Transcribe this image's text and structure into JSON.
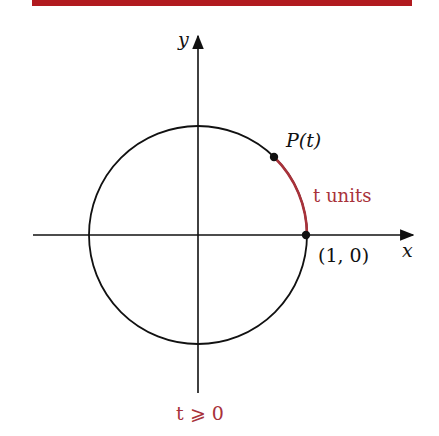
{
  "figure": {
    "header_bar_color": "#b11a1f",
    "accent_color": "#a8323a",
    "ink_color": "#111111",
    "axes": {
      "x_label": "x",
      "y_label": "y"
    },
    "circle": {
      "center_px": [
        198,
        235
      ],
      "radius_px": 109
    },
    "points": [
      {
        "label": "P(t)",
        "px": [
          274,
          157
        ]
      },
      {
        "label": "(1, 0)",
        "px": [
          306,
          235
        ]
      }
    ],
    "arc_label": "t units",
    "condition_label": "t ⩾ 0"
  }
}
